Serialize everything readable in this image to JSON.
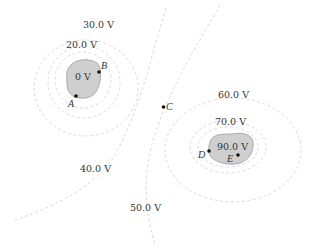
{
  "diagram": {
    "colors": {
      "contour": "#d8d8d8",
      "conductor_fill": "#c8c8c8",
      "conductor_edge": "#9a9a9a",
      "text": "#333333",
      "point": "#111111"
    },
    "equipotential_labels": {
      "v0": "0 V",
      "v20": "20.0 V",
      "v30": "30.0 V",
      "v40": "40.0 V",
      "v50": "50.0 V",
      "v60": "60.0 V",
      "v70": "70.0 V",
      "v90": "90.0 V"
    },
    "points": {
      "A": "A",
      "B": "B",
      "C": "C",
      "D": "D",
      "E": "E"
    },
    "conductors": [
      {
        "name": "left-conductor",
        "potential": "0 V"
      },
      {
        "name": "right-conductor",
        "potential": "90.0 V"
      }
    ]
  }
}
